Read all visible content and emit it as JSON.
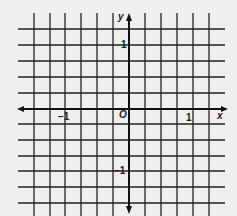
{
  "diagram": {
    "type": "coordinate-grid",
    "axes": {
      "x_label": "x",
      "y_label": "y",
      "origin_label": "O"
    },
    "ticks": {
      "x_pos": "1",
      "x_neg": "−1",
      "y_pos": "1",
      "y_neg": "−1"
    },
    "grid": {
      "columns": 12,
      "rows": 13,
      "squares_per_unit": 4
    },
    "colors": {
      "line": "#222222",
      "background": "#efefef"
    }
  }
}
